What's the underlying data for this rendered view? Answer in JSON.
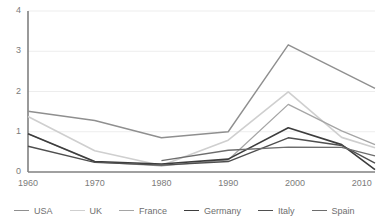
{
  "chart_data": {
    "type": "line",
    "title": "",
    "subtitle": "",
    "xlabel": "",
    "ylabel": "",
    "xlim": [
      1960,
      2012
    ],
    "ylim": [
      0,
      4
    ],
    "yticks": [
      "0",
      "1",
      "2",
      "3",
      "4"
    ],
    "ytick_values": [
      0,
      1,
      2,
      3,
      4
    ],
    "xticks": [
      "1960",
      "1970",
      "1980",
      "1990",
      "2000",
      "2010"
    ],
    "xtick_values": [
      1960,
      1970,
      1980,
      1990,
      2000,
      2010
    ],
    "grid": "horizontal",
    "legend_position": "bottom",
    "series": [
      {
        "name": "USA",
        "color": "#8f8f8f",
        "width": 1.4,
        "x": [
          1960,
          1970,
          1980,
          1990,
          1999,
          2012
        ],
        "values": [
          1.51,
          1.28,
          0.85,
          1.0,
          3.16,
          2.08
        ]
      },
      {
        "name": "UK",
        "color": "#cfcfcf",
        "width": 1.6,
        "x": [
          1960,
          1970,
          1980,
          1990,
          1999,
          2007,
          2012
        ],
        "values": [
          1.38,
          0.53,
          0.16,
          0.79,
          1.99,
          0.86,
          0.6
        ]
      },
      {
        "name": "France",
        "color": "#a5a5a5",
        "width": 1.3,
        "x": [
          1960,
          1970,
          1980,
          1990,
          1999,
          2007,
          2012
        ],
        "values": [
          0.95,
          0.25,
          0.15,
          0.3,
          1.68,
          1.02,
          0.68
        ]
      },
      {
        "name": "Germany",
        "color": "#3d3d3d",
        "width": 1.6,
        "x": [
          1960,
          1970,
          1980,
          1990,
          1999,
          2007,
          2012
        ],
        "values": [
          0.95,
          0.26,
          0.2,
          0.32,
          1.1,
          0.68,
          0.06
        ]
      },
      {
        "name": "Italy",
        "color": "#4f4f4f",
        "width": 1.4,
        "x": [
          1960,
          1970,
          1980,
          1990,
          1999,
          2007,
          2012
        ],
        "values": [
          0.64,
          0.24,
          0.17,
          0.26,
          0.85,
          0.66,
          0.22
        ]
      },
      {
        "name": "Spain",
        "color": "#6d6d6d",
        "width": 1.3,
        "x": [
          1980,
          1990,
          1999,
          2007,
          2012
        ],
        "values": [
          0.28,
          0.54,
          0.62,
          0.61,
          0.4
        ]
      }
    ]
  },
  "axis": {
    "axis_color": "#808080",
    "grid_color": "#ededed",
    "tick_text_color": "#7b7b7b"
  }
}
